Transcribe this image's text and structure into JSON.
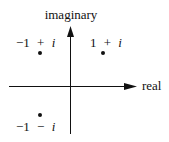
{
  "diagram": {
    "type": "complex-plane",
    "axes": {
      "horizontal_label": "real",
      "vertical_label": "imaginary"
    },
    "points": [
      {
        "label_re": "−1",
        "label_op": "+",
        "label_im": "i",
        "re": -1,
        "im": 1
      },
      {
        "label_re": "1",
        "label_op": "+",
        "label_im": "i",
        "re": 1,
        "im": 1
      },
      {
        "label_re": "−1",
        "label_op": "−",
        "label_im": "i",
        "re": -1,
        "im": -1
      }
    ],
    "colors": {
      "ink": "#111111",
      "background": "#ffffff"
    }
  }
}
